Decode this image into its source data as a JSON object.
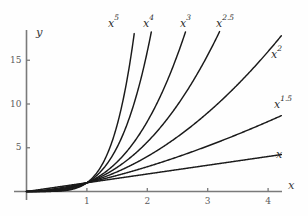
{
  "figure": {
    "background": "#fefefe",
    "curve_color": "#1a1a1a",
    "axis_color": "#7a7a7a",
    "tick_text_color": "#5a5a5a",
    "axis_label_color": "#3a3a3a"
  },
  "axes": {
    "x_axis_label": "x",
    "y_axis_label": "y",
    "x_ticks": [
      "1",
      "2",
      "3",
      "4"
    ],
    "y_ticks": [
      "5",
      "10",
      "15"
    ]
  },
  "curve_labels": [
    {
      "base": "x",
      "exp": "5"
    },
    {
      "base": "x",
      "exp": "4"
    },
    {
      "base": "x",
      "exp": "3"
    },
    {
      "base": "x",
      "exp": "2.5"
    },
    {
      "base": "x",
      "exp": "2"
    },
    {
      "base": "x",
      "exp": "1.5"
    },
    {
      "base": "x",
      "exp": ""
    }
  ],
  "chart_data": {
    "type": "line",
    "title": "",
    "subtitle": "",
    "xlabel": "x",
    "ylabel": "y",
    "xlim": [
      0,
      4.35
    ],
    "ylim": [
      0,
      18.5
    ],
    "grid": false,
    "legend": "inline-curve-labels",
    "x_ticks": [
      1,
      2,
      3,
      4
    ],
    "y_ticks": [
      5,
      10,
      15
    ],
    "note": "Family of power functions y = x^n plotted on 0<=x<=4; steeper curves are clipped at the top of the plot box. All curves pass through (0,0) and (1,1).",
    "series": [
      {
        "name": "x^5",
        "exponent": 5,
        "label": "x^5",
        "x": [
          0,
          0.2,
          0.4,
          0.6,
          0.8,
          1.0,
          1.1,
          1.2,
          1.3,
          1.4,
          1.5,
          1.6,
          1.7,
          1.8
        ],
        "values": [
          0,
          0.0003,
          0.0102,
          0.0778,
          0.3277,
          1.0,
          1.6105,
          2.4883,
          3.7129,
          5.3782,
          7.5938,
          10.486,
          14.199,
          18.895
        ]
      },
      {
        "name": "x^4",
        "exponent": 4,
        "label": "x^4",
        "x": [
          0,
          0.2,
          0.4,
          0.6,
          0.8,
          1.0,
          1.2,
          1.4,
          1.6,
          1.8,
          2.0,
          2.1
        ],
        "values": [
          0,
          0.0016,
          0.0256,
          0.1296,
          0.4096,
          1.0,
          2.0736,
          3.8416,
          6.5536,
          10.4976,
          16.0,
          19.448
        ]
      },
      {
        "name": "x^3",
        "exponent": 3,
        "label": "x^3",
        "x": [
          0,
          0.25,
          0.5,
          0.75,
          1.0,
          1.25,
          1.5,
          1.75,
          2.0,
          2.25,
          2.5,
          2.6
        ],
        "values": [
          0,
          0.0156,
          0.125,
          0.4219,
          1.0,
          1.9531,
          3.375,
          5.3594,
          8.0,
          11.3906,
          15.625,
          17.576
        ]
      },
      {
        "name": "x^2.5",
        "exponent": 2.5,
        "label": "x^2.5",
        "x": [
          0,
          0.5,
          1.0,
          1.5,
          2.0,
          2.5,
          3.0,
          3.2
        ],
        "values": [
          0,
          0.1768,
          1.0,
          2.7557,
          5.6569,
          9.8821,
          15.588,
          18.311
        ]
      },
      {
        "name": "x^2",
        "exponent": 2,
        "label": "x^2",
        "x": [
          0,
          0.5,
          1.0,
          1.5,
          2.0,
          2.5,
          3.0,
          3.5,
          4.0
        ],
        "values": [
          0,
          0.25,
          1.0,
          2.25,
          4.0,
          6.25,
          9.0,
          12.25,
          16.0
        ]
      },
      {
        "name": "x^1.5",
        "exponent": 1.5,
        "label": "x^1.5",
        "x": [
          0,
          0.5,
          1.0,
          1.5,
          2.0,
          2.5,
          3.0,
          3.5,
          4.0
        ],
        "values": [
          0,
          0.3536,
          1.0,
          1.8371,
          2.8284,
          3.9528,
          5.1962,
          6.5479,
          8.0
        ]
      },
      {
        "name": "x",
        "exponent": 1,
        "label": "x",
        "x": [
          0,
          0.5,
          1.0,
          1.5,
          2.0,
          2.5,
          3.0,
          3.5,
          4.0
        ],
        "values": [
          0,
          0.5,
          1.0,
          1.5,
          2.0,
          2.5,
          3.0,
          3.5,
          4.0
        ]
      }
    ]
  },
  "label_positions": {
    "x5": {
      "left": 108,
      "top": 14
    },
    "x4": {
      "left": 143,
      "top": 14
    },
    "x3": {
      "left": 180,
      "top": 14
    },
    "x25": {
      "left": 216,
      "top": 14
    },
    "x2": {
      "left": 271,
      "top": 45
    },
    "x15": {
      "left": 274,
      "top": 95
    },
    "x1": {
      "left": 276,
      "top": 145
    },
    "ylab": {
      "left": 36,
      "top": 27
    },
    "xlab": {
      "left": 288,
      "top": 180
    }
  }
}
